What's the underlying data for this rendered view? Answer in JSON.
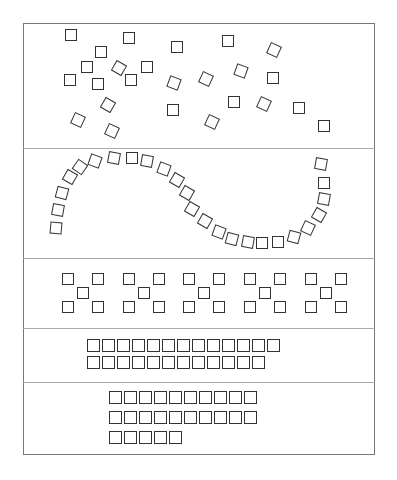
{
  "figure": {
    "sections": [
      {
        "name": "scattered",
        "count": 27
      },
      {
        "name": "s-curve",
        "count": 32
      },
      {
        "name": "dice-five-groups",
        "groups": 5,
        "per_group": 5
      },
      {
        "name": "two-rows",
        "rows": [
          13,
          12
        ]
      },
      {
        "name": "three-rows",
        "rows": [
          10,
          10,
          5
        ]
      }
    ],
    "colors": {
      "stroke": "#333333",
      "frame": "#777777",
      "divider": "#aaaaaa"
    }
  },
  "scattered": [
    [
      65,
      29,
      0
    ],
    [
      95,
      46,
      0
    ],
    [
      123,
      32,
      0
    ],
    [
      171,
      41,
      0
    ],
    [
      222,
      35,
      0
    ],
    [
      268,
      44,
      25
    ],
    [
      81,
      61,
      0
    ],
    [
      113,
      62,
      30
    ],
    [
      141,
      61,
      0
    ],
    [
      64,
      74,
      0
    ],
    [
      92,
      78,
      0
    ],
    [
      125,
      74,
      0
    ],
    [
      168,
      77,
      20
    ],
    [
      200,
      73,
      25
    ],
    [
      235,
      65,
      20
    ],
    [
      267,
      72,
      0
    ],
    [
      102,
      99,
      30
    ],
    [
      72,
      114,
      25
    ],
    [
      106,
      125,
      25
    ],
    [
      167,
      104,
      0
    ],
    [
      206,
      116,
      25
    ],
    [
      228,
      96,
      0
    ],
    [
      258,
      98,
      25
    ],
    [
      293,
      102,
      0
    ],
    [
      318,
      120,
      0
    ]
  ],
  "curve": [
    [
      50,
      222,
      5
    ],
    [
      52,
      204,
      10
    ],
    [
      56,
      187,
      15
    ],
    [
      64,
      171,
      30
    ],
    [
      74,
      161,
      35
    ],
    [
      89,
      155,
      20
    ],
    [
      108,
      152,
      10
    ],
    [
      126,
      152,
      0
    ],
    [
      141,
      155,
      10
    ],
    [
      158,
      163,
      20
    ],
    [
      171,
      174,
      30
    ],
    [
      181,
      187,
      30
    ],
    [
      186,
      203,
      30
    ],
    [
      199,
      215,
      30
    ],
    [
      213,
      226,
      20
    ],
    [
      226,
      233,
      15
    ],
    [
      242,
      236,
      10
    ],
    [
      256,
      237,
      0
    ],
    [
      272,
      236,
      0
    ],
    [
      288,
      231,
      15
    ],
    [
      302,
      222,
      25
    ],
    [
      313,
      209,
      30
    ],
    [
      318,
      193,
      10
    ],
    [
      318,
      177,
      0
    ],
    [
      315,
      158,
      10
    ]
  ],
  "grid4": {
    "rows": [
      13,
      12
    ]
  },
  "grid5": {
    "rows": [
      10,
      10,
      5
    ]
  }
}
